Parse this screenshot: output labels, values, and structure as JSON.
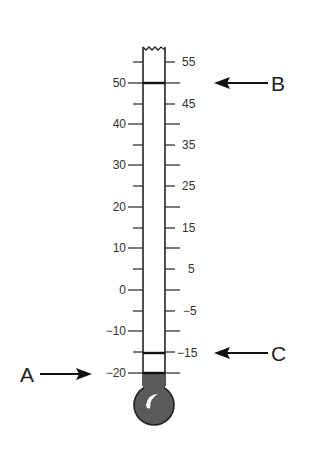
{
  "diagram": {
    "type": "thermometer",
    "left_scale": {
      "labels": [
        "50",
        "40",
        "30",
        "20",
        "10",
        "0",
        "−10",
        "−20"
      ],
      "values": [
        50,
        40,
        30,
        20,
        10,
        0,
        -10,
        -20
      ]
    },
    "right_scale": {
      "labels": [
        "55",
        "45",
        "35",
        "25",
        "15",
        "5",
        "−5",
        "−15"
      ],
      "values": [
        55,
        45,
        35,
        25,
        15,
        5,
        -5,
        -15
      ]
    },
    "markers": [
      {
        "letter": "A",
        "value": -20,
        "side": "left",
        "arrow": "arrow-right"
      },
      {
        "letter": "B",
        "value": 50,
        "side": "right",
        "arrow": "arrow-left"
      },
      {
        "letter": "C",
        "value": -15,
        "side": "right",
        "arrow": "arrow-left"
      }
    ],
    "liquid_level": -20,
    "colors": {
      "liquid": "#5a5a5a",
      "line": "#222222",
      "text": "#333333"
    }
  }
}
